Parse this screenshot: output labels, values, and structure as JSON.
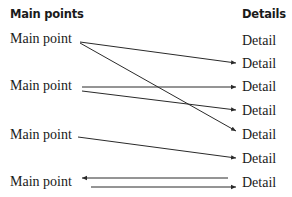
{
  "headers": {
    "left": "Main points",
    "right": "Details"
  },
  "main_points": [
    {
      "label": "Main point",
      "y": 42
    },
    {
      "label": "Main point",
      "y": 86
    },
    {
      "label": "Main point",
      "y": 134
    },
    {
      "label": "Main point",
      "y": 182
    }
  ],
  "details": [
    {
      "label": "Detail",
      "y": 41
    },
    {
      "label": "Detail",
      "y": 64
    },
    {
      "label": "Detail",
      "y": 87
    },
    {
      "label": "Detail",
      "y": 111
    },
    {
      "label": "Detail",
      "y": 135
    },
    {
      "label": "Detail",
      "y": 159
    },
    {
      "label": "Detail",
      "y": 183
    }
  ],
  "connections": [
    {
      "from_main": 1,
      "to_detail": 2,
      "direction": "right"
    },
    {
      "from_main": 1,
      "to_detail": 5,
      "direction": "right"
    },
    {
      "from_main": 2,
      "to_detail": 3,
      "direction": "right"
    },
    {
      "from_main": 2,
      "to_detail": 4,
      "direction": "right"
    },
    {
      "from_main": 3,
      "to_detail": 6,
      "direction": "right"
    },
    {
      "from_main": 4,
      "to_detail": 7,
      "direction": "left"
    },
    {
      "from_main": 4,
      "to_detail": 7,
      "direction": "right"
    }
  ],
  "colors": {
    "line": "#2a2a2a",
    "text": "#1a1a1a"
  }
}
